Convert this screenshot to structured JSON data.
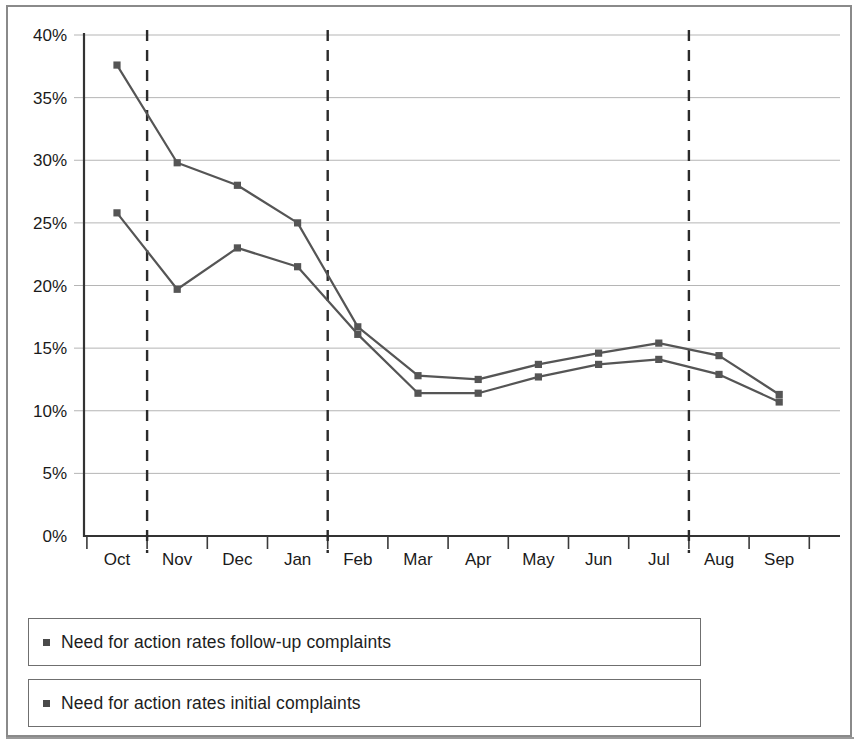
{
  "chart_data": {
    "type": "line",
    "title": "",
    "subtitle": "",
    "xlabel": "",
    "ylabel": "",
    "categories": [
      "Oct",
      "Nov",
      "Dec",
      "Jan",
      "Feb",
      "Mar",
      "Apr",
      "May",
      "Jun",
      "Jul",
      "Aug",
      "Sep"
    ],
    "ylim": [
      0,
      40
    ],
    "ytick_labels": [
      "0%",
      "5%",
      "10%",
      "15%",
      "20%",
      "25%",
      "30%",
      "35%",
      "40%"
    ],
    "ytick_values": [
      0,
      5,
      10,
      15,
      20,
      25,
      30,
      35,
      40
    ],
    "grid": true,
    "legend_position": "bottom",
    "series": [
      {
        "name": "Need for action rates follow-up complaints",
        "color": "#555555",
        "marker": "square",
        "values": [
          37.6,
          29.8,
          28.0,
          25.0,
          16.7,
          12.8,
          12.5,
          13.7,
          14.6,
          15.4,
          14.4,
          11.3
        ]
      },
      {
        "name": "Need for action rates initial complaints",
        "color": "#555555",
        "marker": "square",
        "values": [
          25.8,
          19.7,
          23.0,
          21.5,
          16.1,
          11.4,
          11.4,
          12.7,
          13.7,
          14.1,
          12.9,
          10.7
        ]
      }
    ],
    "annotations": [
      {
        "type": "vertical-dashed-line",
        "after_category": "Oct"
      },
      {
        "type": "vertical-dashed-line",
        "after_category": "Jan"
      },
      {
        "type": "vertical-dashed-line",
        "after_category": "Jul"
      }
    ]
  },
  "legend": {
    "items": [
      {
        "label": "Need for action rates follow-up complaints"
      },
      {
        "label": "Need for action rates initial complaints"
      }
    ]
  },
  "colors": {
    "line": "#555555",
    "grid": "#b5b5b5",
    "axis": "#333333",
    "frame": "#8a8a8a",
    "dashed": "#2b2b2b",
    "text": "#1a1a1a"
  }
}
